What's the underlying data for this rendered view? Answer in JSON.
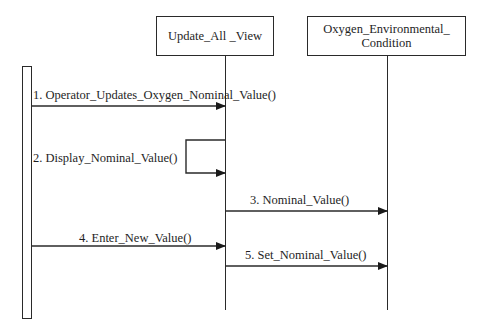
{
  "diagram": {
    "type": "sequence",
    "participants": [
      {
        "id": "actor",
        "label": ""
      },
      {
        "id": "view",
        "label": "Update_All _View"
      },
      {
        "id": "condition",
        "label": "Oxygen_Environmental_\nCondition"
      }
    ],
    "messages": [
      {
        "num": 1,
        "label": "1. Operator_Updates_Oxygen_Nominal_Value()",
        "from": "actor",
        "to": "view"
      },
      {
        "num": 2,
        "label": "2. Display_Nominal_Value()",
        "from": "view",
        "to": "view"
      },
      {
        "num": 3,
        "label": "3. Nominal_Value()",
        "from": "view",
        "to": "condition"
      },
      {
        "num": 4,
        "label": "4. Enter_New_Value()",
        "from": "actor",
        "to": "view"
      },
      {
        "num": 5,
        "label": "5. Set_Nominal_Value()",
        "from": "view",
        "to": "condition"
      }
    ],
    "colors": {
      "line": "#2a2a2a",
      "background": "#ffffff",
      "text": "#1e1e1e"
    }
  }
}
